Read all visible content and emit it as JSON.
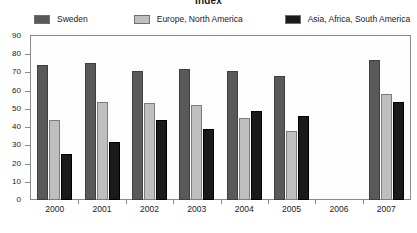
{
  "chart_data": {
    "type": "bar",
    "title": "Index",
    "xlabel": "",
    "ylabel": "",
    "ylim": [
      0,
      90
    ],
    "yticks": [
      0,
      10,
      20,
      30,
      40,
      50,
      60,
      70,
      80,
      90
    ],
    "grid": false,
    "legend_position": "top",
    "categories": [
      "2000",
      "2001",
      "2002",
      "2003",
      "2004",
      "2005",
      "2006",
      "2007"
    ],
    "series": [
      {
        "name": "Sweden",
        "color": "#595959",
        "values": [
          74,
          75,
          71,
          72,
          71,
          68,
          null,
          77
        ]
      },
      {
        "name": "Europe, North America",
        "color": "#bfbfbf",
        "values": [
          44,
          54,
          53,
          52,
          45,
          38,
          null,
          58
        ]
      },
      {
        "name": "Asia, Africa, South America",
        "color": "#1a1a1a",
        "values": [
          25,
          32,
          44,
          39,
          49,
          46,
          null,
          54
        ]
      }
    ]
  },
  "axes": {
    "frame_color": "#8a8a8a",
    "background": "#fdfdfd"
  }
}
